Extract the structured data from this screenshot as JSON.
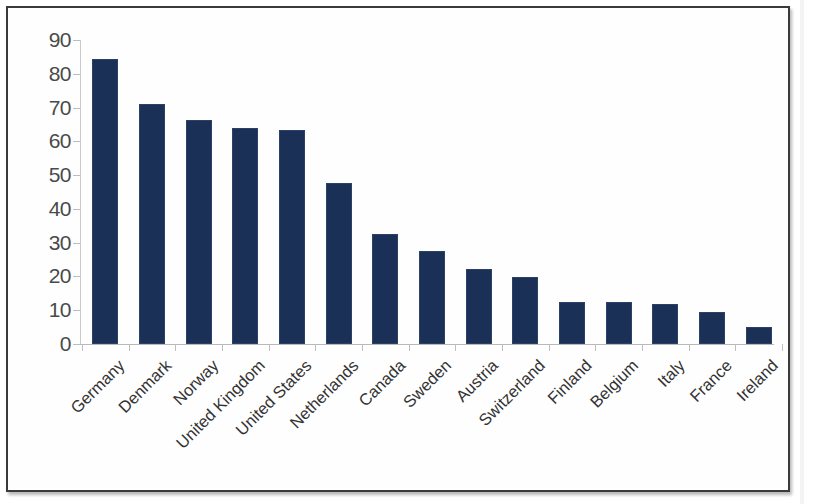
{
  "chart_data": {
    "type": "bar",
    "title": "",
    "subtitle": "",
    "xlabel": "",
    "ylabel": "",
    "ylim": [
      0,
      90
    ],
    "ytick_step": 10,
    "yticks": [
      0,
      10,
      20,
      30,
      40,
      50,
      60,
      70,
      80,
      90
    ],
    "ytick_labels": [
      "0",
      "10",
      "20",
      "30",
      "40",
      "50",
      "60",
      "70",
      "80",
      "90"
    ],
    "grid": false,
    "legend": null,
    "bar_color": "#1a3057",
    "categories": [
      "Germany",
      "Denmark",
      "Norway",
      "United Kingdom",
      "United States",
      "Netherlands",
      "Canada",
      "Sweden",
      "Austria",
      "Switzerland",
      "Finland",
      "Belgium",
      "Italy",
      "France",
      "Ireland"
    ],
    "values": [
      84.5,
      71.2,
      66.3,
      63.8,
      63.4,
      47.7,
      32.6,
      27.4,
      22.2,
      19.8,
      12.4,
      12.3,
      11.8,
      9.6,
      5.0
    ]
  },
  "axis": {
    "y_axis_name": "y-axis",
    "x_axis_name": "x-axis"
  }
}
